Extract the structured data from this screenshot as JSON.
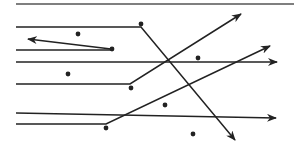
{
  "diagram": {
    "width": 294,
    "height": 154,
    "background": "#ffffff",
    "stroke_color": "#222222",
    "top_rule": {
      "x1": 16,
      "y1": 4,
      "x2": 294,
      "y2": 4
    },
    "lines": [
      {
        "id": "l1",
        "points": [
          [
            16,
            27
          ],
          [
            141,
            27
          ],
          [
            235,
            140
          ]
        ],
        "arrow": true
      },
      {
        "id": "l2",
        "points": [
          [
            111,
            49
          ],
          [
            28,
            39
          ]
        ],
        "arrow": true
      },
      {
        "id": "l3",
        "points": [
          [
            16,
            50
          ],
          [
            111,
            50
          ]
        ],
        "arrow": false
      },
      {
        "id": "l4",
        "points": [
          [
            16,
            62
          ],
          [
            277,
            62
          ]
        ],
        "arrow": true
      },
      {
        "id": "l5",
        "points": [
          [
            16,
            84
          ],
          [
            130,
            84
          ],
          [
            241,
            14
          ]
        ],
        "arrow": true
      },
      {
        "id": "l6",
        "points": [
          [
            16,
            113
          ],
          [
            276,
            118
          ]
        ],
        "arrow": true
      },
      {
        "id": "l7",
        "points": [
          [
            16,
            124
          ],
          [
            106,
            124
          ],
          [
            270,
            46
          ]
        ],
        "arrow": true
      }
    ],
    "dots": [
      {
        "x": 141,
        "y": 24
      },
      {
        "x": 78,
        "y": 34
      },
      {
        "x": 112,
        "y": 49
      },
      {
        "x": 68,
        "y": 74
      },
      {
        "x": 198,
        "y": 58
      },
      {
        "x": 131,
        "y": 88
      },
      {
        "x": 165,
        "y": 105
      },
      {
        "x": 106,
        "y": 128
      },
      {
        "x": 193,
        "y": 134
      }
    ]
  }
}
